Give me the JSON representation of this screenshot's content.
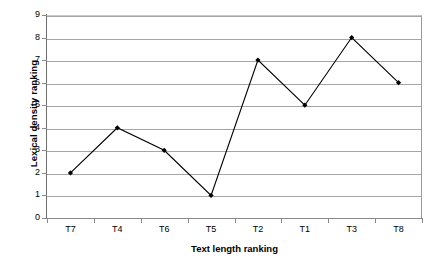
{
  "chart_data": {
    "type": "line",
    "title": "",
    "xlabel": "Text length ranking",
    "ylabel": "Lexical density ranking",
    "categories": [
      "T7",
      "T4",
      "T6",
      "T5",
      "T2",
      "T1",
      "T3",
      "T8"
    ],
    "values": [
      2,
      4,
      3,
      1,
      7,
      5,
      8,
      6
    ],
    "ylim": [
      0,
      9
    ],
    "yticks": [
      0,
      1,
      2,
      3,
      4,
      5,
      6,
      7,
      8,
      9
    ],
    "ytick_labels": [
      "0",
      "1",
      "2",
      "3",
      "4",
      "5",
      "6",
      "7",
      "8",
      "9"
    ],
    "grid": true,
    "legend": false,
    "legend_position": "none",
    "series": [
      {
        "name": "Lexical density ranking",
        "values": [
          2,
          4,
          3,
          1,
          7,
          5,
          8,
          6
        ],
        "line_color": "#000000",
        "marker": "diamond",
        "marker_color": "#000000"
      }
    ],
    "colors": {
      "line": "#000000",
      "marker": "#000000",
      "gridline": "#a6a6a6",
      "axis": "#8a8a8a",
      "background": "#ffffff",
      "text": "#000000"
    }
  }
}
